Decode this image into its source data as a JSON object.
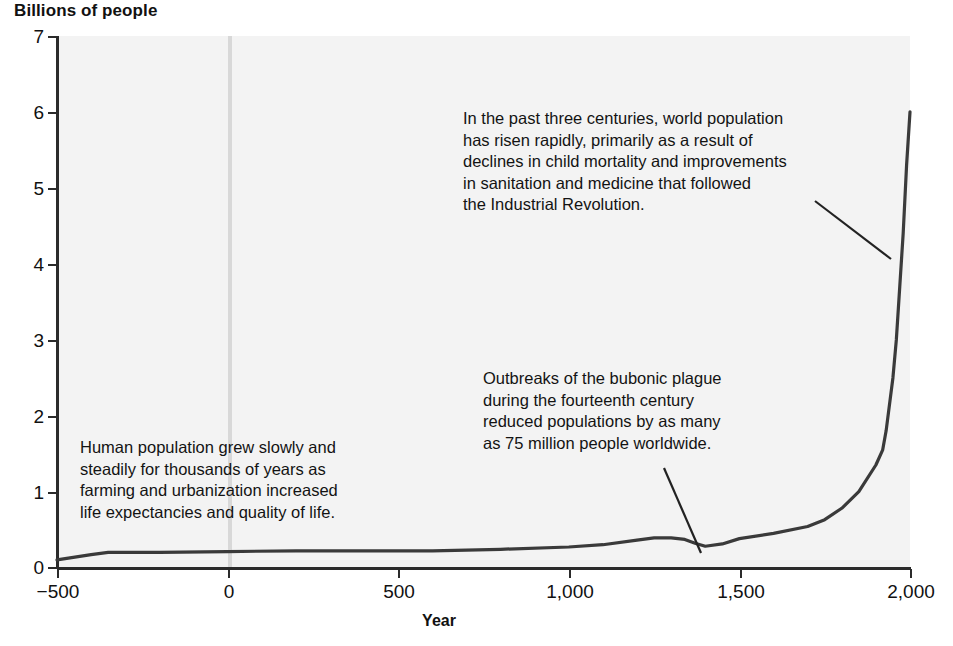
{
  "chart_data": {
    "type": "line",
    "title": "Billions of people",
    "xlabel": "Year",
    "ylabel": "Billions of people",
    "xlim": [
      -500,
      2000
    ],
    "ylim": [
      0,
      7
    ],
    "grid": false,
    "legend": "none",
    "xticklabels": [
      "−500",
      "0",
      "500",
      "1,000",
      "1,500",
      "2,000"
    ],
    "xticks": [
      -500,
      0,
      500,
      1000,
      1500,
      2000
    ],
    "yticklabels": [
      "0",
      "1",
      "2",
      "3",
      "4",
      "5",
      "6",
      "7"
    ],
    "yticks": [
      0,
      1,
      2,
      3,
      4,
      5,
      6,
      7
    ],
    "series": [
      {
        "name": "World population",
        "units": "billions",
        "x": [
          -500,
          -400,
          -350,
          -200,
          0,
          200,
          400,
          600,
          800,
          1000,
          1100,
          1200,
          1250,
          1300,
          1340,
          1370,
          1400,
          1450,
          1500,
          1600,
          1700,
          1750,
          1800,
          1850,
          1900,
          1920,
          1930,
          1950,
          1960,
          1970,
          1980,
          1990,
          2000
        ],
        "y": [
          0.1,
          0.17,
          0.2,
          0.2,
          0.21,
          0.22,
          0.22,
          0.22,
          0.24,
          0.27,
          0.3,
          0.36,
          0.39,
          0.39,
          0.37,
          0.32,
          0.28,
          0.31,
          0.38,
          0.45,
          0.54,
          0.63,
          0.78,
          1.0,
          1.35,
          1.55,
          1.8,
          2.5,
          3.0,
          3.7,
          4.4,
          5.3,
          6.0
        ]
      }
    ],
    "annotations": [
      {
        "id": "growth",
        "text": "In the past three centuries, world population\nhas risen rapidly, primarily as a result of\ndeclines in child mortality and improvements\nin sanitation and medicine that followed\nthe Industrial Revolution.",
        "points_to_year": 1925,
        "points_to_value": 2.0
      },
      {
        "id": "plague",
        "text": "Outbreaks of the bubonic plague\nduring the fourteenth century\nreduced populations by as many\nas 75 million people worldwide.",
        "points_to_year": 1400,
        "points_to_value": 0.28
      },
      {
        "id": "slow",
        "text": "Human population grew slowly and\nsteadily for thousands of years as\nfarming and urbanization increased\nlife expectancies and quality of life.",
        "points_to_year": null,
        "points_to_value": null
      }
    ],
    "marker_lines": [
      {
        "name": "year-zero-marker",
        "year": 0,
        "color": "#d8d8d8"
      }
    ],
    "colors": {
      "line": "#3a3a3a",
      "axis": "#2b2b2b",
      "plot_background": "#f3f3f3",
      "page_background": "#ffffff",
      "text": "#111111",
      "marker": "#d8d8d8"
    }
  }
}
